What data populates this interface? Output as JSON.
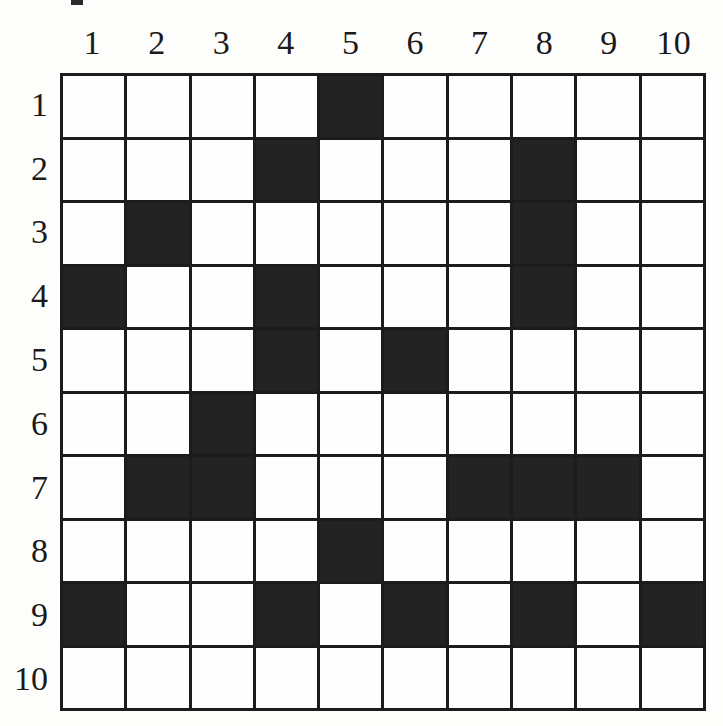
{
  "figure": {
    "kind": "grid-puzzle",
    "rows": 10,
    "cols": 10,
    "fill_color": "#232323",
    "empty_color": "#fefefe",
    "line_color": "#1c1c1c",
    "background_color": "#ffffff"
  },
  "column_headers": [
    "1",
    "2",
    "3",
    "4",
    "5",
    "6",
    "7",
    "8",
    "9",
    "10"
  ],
  "row_headers": [
    "1",
    "2",
    "3",
    "4",
    "5",
    "6",
    "7",
    "8",
    "9",
    "10"
  ],
  "chart_data": {
    "type": "heatmap",
    "title": "",
    "xlabel": "",
    "ylabel": "",
    "categories": [
      "1",
      "2",
      "3",
      "4",
      "5",
      "6",
      "7",
      "8",
      "9",
      "10"
    ],
    "row_categories": [
      "1",
      "2",
      "3",
      "4",
      "5",
      "6",
      "7",
      "8",
      "9",
      "10"
    ],
    "grid": [
      [
        0,
        0,
        0,
        0,
        1,
        0,
        0,
        0,
        0,
        0
      ],
      [
        0,
        0,
        0,
        1,
        0,
        0,
        0,
        1,
        0,
        0
      ],
      [
        0,
        1,
        0,
        0,
        0,
        0,
        0,
        1,
        0,
        0
      ],
      [
        1,
        0,
        0,
        1,
        0,
        0,
        0,
        1,
        0,
        0
      ],
      [
        0,
        0,
        0,
        1,
        0,
        1,
        0,
        0,
        0,
        0
      ],
      [
        0,
        0,
        1,
        0,
        0,
        0,
        0,
        0,
        0,
        0
      ],
      [
        0,
        1,
        1,
        0,
        0,
        0,
        1,
        1,
        1,
        0
      ],
      [
        0,
        0,
        0,
        0,
        1,
        0,
        0,
        0,
        0,
        0
      ],
      [
        1,
        0,
        0,
        1,
        0,
        1,
        0,
        1,
        0,
        1
      ],
      [
        0,
        0,
        0,
        0,
        0,
        0,
        0,
        0,
        0,
        0
      ]
    ],
    "filled_cells": [
      {
        "row": 1,
        "col": 5
      },
      {
        "row": 2,
        "col": 4
      },
      {
        "row": 2,
        "col": 8
      },
      {
        "row": 3,
        "col": 2
      },
      {
        "row": 3,
        "col": 8
      },
      {
        "row": 4,
        "col": 1
      },
      {
        "row": 4,
        "col": 4
      },
      {
        "row": 4,
        "col": 8
      },
      {
        "row": 5,
        "col": 4
      },
      {
        "row": 5,
        "col": 6
      },
      {
        "row": 6,
        "col": 3
      },
      {
        "row": 7,
        "col": 2
      },
      {
        "row": 7,
        "col": 3
      },
      {
        "row": 7,
        "col": 7
      },
      {
        "row": 7,
        "col": 8
      },
      {
        "row": 7,
        "col": 9
      },
      {
        "row": 8,
        "col": 5
      },
      {
        "row": 9,
        "col": 1
      },
      {
        "row": 9,
        "col": 4
      },
      {
        "row": 9,
        "col": 6
      },
      {
        "row": 9,
        "col": 8
      },
      {
        "row": 9,
        "col": 10
      }
    ],
    "row_counts": [
      1,
      2,
      2,
      3,
      2,
      1,
      5,
      1,
      5,
      0
    ],
    "col_counts": [
      2,
      2,
      2,
      4,
      2,
      2,
      1,
      4,
      1,
      1
    ],
    "total_filled": 22,
    "grid_on": true,
    "legend_position": "none"
  }
}
